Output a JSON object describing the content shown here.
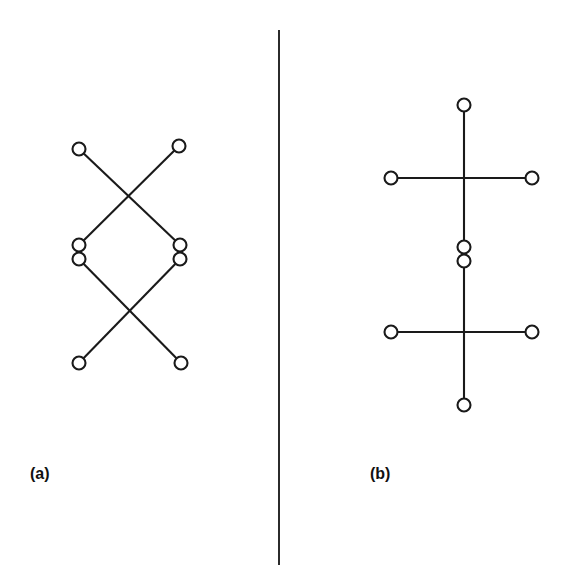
{
  "figure": {
    "width": 567,
    "height": 588,
    "background": "#ffffff",
    "stroke_color": "#1a1a1a",
    "node_fill": "#ffffff",
    "node_radius": 6.5,
    "line_width": 2.1
  },
  "divider": {
    "name": "panel-divider",
    "x": 279,
    "y1": 30,
    "y2": 565,
    "color": "#2b2b2b"
  },
  "panels": [
    {
      "key": "a",
      "label": "(a)",
      "label_x": 30,
      "label_y": 465,
      "description": "two crossing edge pairs forming a butterfly with a central diamond",
      "nodes": [
        {
          "id": "a-top-left",
          "name": "node-a-top-left",
          "x": 79,
          "y": 149
        },
        {
          "id": "a-top-right",
          "name": "node-a-top-right",
          "x": 179,
          "y": 146
        },
        {
          "id": "a-mid-left-upper",
          "name": "node-a-mid-left-upper",
          "x": 79,
          "y": 245
        },
        {
          "id": "a-mid-left-lower",
          "name": "node-a-mid-left-lower",
          "x": 79,
          "y": 259
        },
        {
          "id": "a-mid-right-upper",
          "name": "node-a-mid-right-upper",
          "x": 180,
          "y": 245
        },
        {
          "id": "a-mid-right-lower",
          "name": "node-a-mid-right-lower",
          "x": 180,
          "y": 259
        },
        {
          "id": "a-bottom-left",
          "name": "node-a-bottom-left",
          "x": 79,
          "y": 363
        },
        {
          "id": "a-bottom-right",
          "name": "node-a-bottom-right",
          "x": 181,
          "y": 363
        }
      ],
      "edges": [
        {
          "name": "edge-a-topleft-to-midright",
          "from": "a-top-left",
          "to": "a-mid-right-upper"
        },
        {
          "name": "edge-a-topright-to-midleft",
          "from": "a-top-right",
          "to": "a-mid-left-upper"
        },
        {
          "name": "edge-a-midleft-to-bottomright",
          "from": "a-mid-left-lower",
          "to": "a-bottom-right"
        },
        {
          "name": "edge-a-midright-to-bottomleft",
          "from": "a-mid-right-lower",
          "to": "a-bottom-left"
        }
      ]
    },
    {
      "key": "b",
      "label": "(b)",
      "label_x": 370,
      "label_y": 465,
      "description": "two plus-shaped crosses stacked on a shared vertical spine",
      "nodes": [
        {
          "id": "b-top",
          "name": "node-b-top",
          "x": 464,
          "y": 105
        },
        {
          "id": "b-upper-left",
          "name": "node-b-upper-left",
          "x": 391,
          "y": 178
        },
        {
          "id": "b-upper-right",
          "name": "node-b-upper-right",
          "x": 532,
          "y": 178
        },
        {
          "id": "b-center-upper",
          "name": "node-b-center-upper",
          "x": 464,
          "y": 247
        },
        {
          "id": "b-center-lower",
          "name": "node-b-center-lower",
          "x": 464,
          "y": 261
        },
        {
          "id": "b-lower-left",
          "name": "node-b-lower-left",
          "x": 391,
          "y": 332
        },
        {
          "id": "b-lower-right",
          "name": "node-b-lower-right",
          "x": 532,
          "y": 332
        },
        {
          "id": "b-bottom",
          "name": "node-b-bottom",
          "x": 464,
          "y": 405
        }
      ],
      "edges": [
        {
          "name": "edge-b-top-to-centerupper",
          "from": "b-top",
          "to": "b-center-upper"
        },
        {
          "name": "edge-b-upperleft-to-upperright",
          "from": "b-upper-left",
          "to": "b-upper-right"
        },
        {
          "name": "edge-b-centerlower-to-bottom",
          "from": "b-center-lower",
          "to": "b-bottom"
        },
        {
          "name": "edge-b-lowerleft-to-lowerright",
          "from": "b-lower-left",
          "to": "b-lower-right"
        }
      ]
    }
  ]
}
